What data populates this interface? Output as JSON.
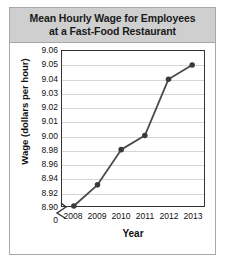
{
  "card": {
    "title_line1": "Mean Hourly Wage for Employees",
    "title_line2": "at a Fast-Food Restaurant"
  },
  "chart_data": {
    "type": "line",
    "title": "Mean Hourly Wage for Employees at a Fast-Food Restaurant",
    "xlabel": "Year",
    "ylabel": "Wage (dollars per hour)",
    "categories": [
      "2008",
      "2009",
      "2010",
      "2011",
      "2012",
      "2013"
    ],
    "values": [
      8.9,
      8.93,
      8.98,
      9.0,
      9.04,
      9.05
    ],
    "ytick_labels": [
      "9.06",
      "9.05",
      "9.04",
      "9.03",
      "9.02",
      "9.01",
      "9.00",
      "8.98",
      "8.96",
      "8.94",
      "8.92",
      "8.90",
      "0"
    ],
    "ytick_values": [
      9.06,
      9.05,
      9.04,
      9.03,
      9.02,
      9.01,
      9.0,
      8.98,
      8.96,
      8.94,
      8.92,
      8.9,
      0
    ],
    "y_axis_broken": true,
    "y_axis_break_label": "0",
    "ylim": [
      8.9,
      9.06
    ],
    "grid": true,
    "legend": false,
    "marker": "circle",
    "line_color": "#4a4a4a",
    "marker_color": "#3a3a3a",
    "grid_color": "#d5d5d5"
  }
}
